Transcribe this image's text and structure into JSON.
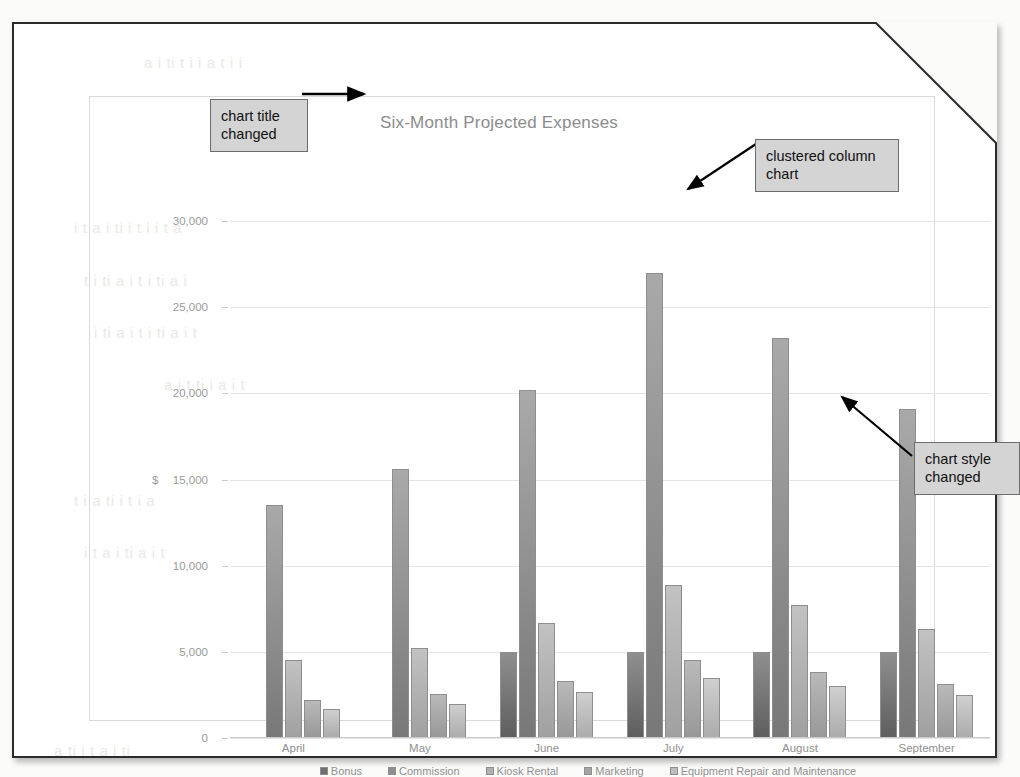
{
  "document": {
    "type": "scanned-page",
    "corner_fold": true
  },
  "chart": {
    "title": "Six-Month Projected Expenses",
    "axis_unit_label": "$"
  },
  "annotations": [
    {
      "id": "chart-title-changed",
      "text": "chart title\nchanged"
    },
    {
      "id": "clustered-column-chart",
      "text": "clustered column\nchart"
    },
    {
      "id": "chart-style-changed",
      "text": "chart style\nchanged"
    }
  ],
  "ghost_text": [
    {
      "text": "a  i   ti   t   i    i  a  t   i   i",
      "left": 130,
      "top": 30
    },
    {
      "text": "i   t   a   i    ti     i   t   i    i  t   a",
      "left": 60,
      "top": 195
    },
    {
      "text": "t   i   ti    a     i  t    i   ti   a    i",
      "left": 70,
      "top": 248
    },
    {
      "text": "i   ti   a   i   t   i    ti   a    i   t",
      "left": 80,
      "top": 300
    },
    {
      "text": "a   i   t    ti     i    a    i    t",
      "left": 150,
      "top": 352
    },
    {
      "text": "t   i    a    ti    i     t    i     a",
      "left": 60,
      "top": 468
    },
    {
      "text": "i    t   a    i   ti     a    i    t",
      "left": 70,
      "top": 520
    },
    {
      "text": "a   ti    i    t    a    i    ti",
      "left": 40,
      "top": 718
    }
  ],
  "chart_data": {
    "type": "bar",
    "title": "Six-Month Projected Expenses",
    "xlabel": "",
    "ylabel": "$",
    "ylim": [
      0,
      30000
    ],
    "ytick_values": [
      0,
      5000,
      10000,
      15000,
      20000,
      25000,
      30000
    ],
    "ytick_labels": [
      "0",
      "5,000",
      "10,000",
      "15,000",
      "20,000",
      "25,000",
      "30,000"
    ],
    "grid": true,
    "legend_position": "bottom",
    "categories": [
      "April",
      "May",
      "June",
      "July",
      "August",
      "September"
    ],
    "series": [
      {
        "name": "Bonus",
        "values": [
          0,
          0,
          5000,
          5000,
          5000,
          5000
        ]
      },
      {
        "name": "Commission",
        "values": [
          13500,
          15600,
          20200,
          27000,
          23200,
          19100
        ]
      },
      {
        "name": "Kiosk Rental",
        "values": [
          4500,
          5200,
          6700,
          8900,
          7700,
          6300
        ]
      },
      {
        "name": "Marketing",
        "values": [
          2200,
          2550,
          3300,
          4500,
          3850,
          3150
        ]
      },
      {
        "name": "Equipment Repair and Maintenance",
        "values": [
          1700,
          2000,
          2650,
          3500,
          3000,
          2500
        ]
      }
    ]
  }
}
